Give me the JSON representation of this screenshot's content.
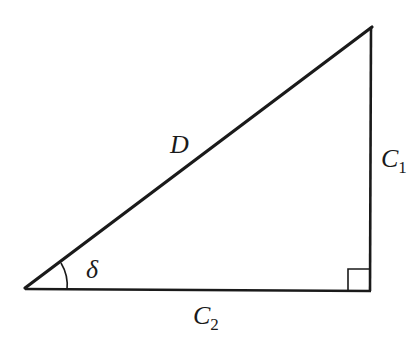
{
  "diagram": {
    "type": "right-triangle",
    "vertices": {
      "acute_vertex": [
        25,
        288
      ],
      "top_vertex": [
        372,
        26
      ],
      "right_angle_vertex": [
        370,
        291
      ]
    },
    "stroke_color": "#1a1a1a",
    "labels": {
      "hypotenuse": {
        "main": "D",
        "sub": ""
      },
      "vertical_leg": {
        "main": "C",
        "sub": "1"
      },
      "horizontal_leg": {
        "main": "C",
        "sub": "2"
      },
      "angle": {
        "main": "δ",
        "sub": ""
      }
    },
    "right_angle_marker": true
  }
}
